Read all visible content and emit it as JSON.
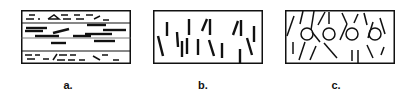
{
  "figure": {
    "panels": [
      {
        "id": "a",
        "label": "a.",
        "description": "layered horizontal fibers/platelets: thin dashed top and bottom layers, thick horizontal bars in middle layer"
      },
      {
        "id": "b",
        "label": "b.",
        "description": "vertically aligned short rods randomly positioned"
      },
      {
        "id": "c",
        "label": "c.",
        "description": "mixed orientation rods with circular particles and a vertical divider"
      }
    ],
    "colors": {
      "stroke": "#111111",
      "background": "#ffffff"
    }
  }
}
